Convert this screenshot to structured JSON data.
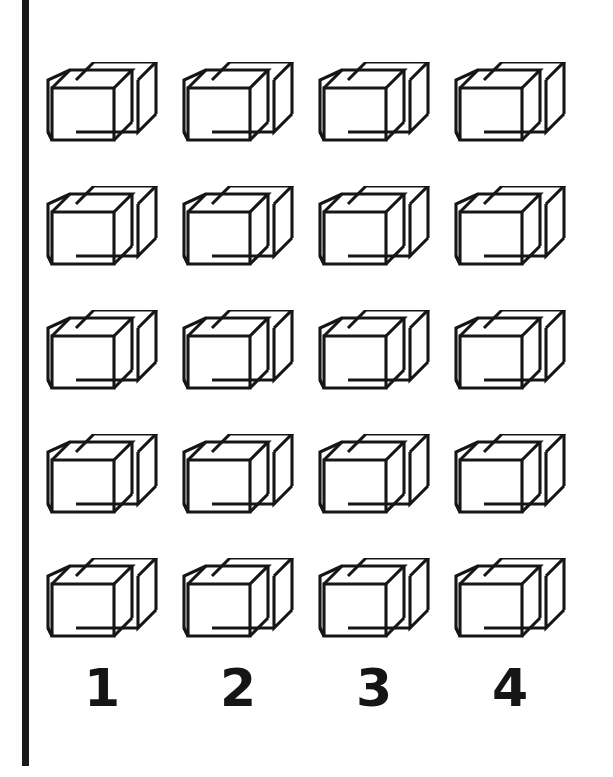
{
  "figure": {
    "name": "cube-grid-figure",
    "background_color": "#ffffff",
    "ink_color": "#161616",
    "rows": 5,
    "columns": 4,
    "total_cubes": 20,
    "shape_name": "necker-cube-outline"
  },
  "left_rule": {
    "name": "left-vertical-rule",
    "color": "#1a1a1a"
  },
  "columns": [
    {
      "index": 1,
      "label": "1",
      "x": 0
    },
    {
      "index": 2,
      "label": "2",
      "x": 136
    },
    {
      "index": 3,
      "label": "3",
      "x": 272
    },
    {
      "index": 4,
      "label": "4",
      "x": 408
    }
  ],
  "rows": [
    {
      "index": 1,
      "y": 0
    },
    {
      "index": 2,
      "y": 124
    },
    {
      "index": 3,
      "y": 248
    },
    {
      "index": 4,
      "y": 372
    },
    {
      "index": 5,
      "y": 496
    }
  ],
  "cells": [
    {
      "row": 1,
      "column": 1,
      "label": "cube-r1-c1"
    },
    {
      "row": 1,
      "column": 2,
      "label": "cube-r1-c2"
    },
    {
      "row": 1,
      "column": 3,
      "label": "cube-r1-c3"
    },
    {
      "row": 1,
      "column": 4,
      "label": "cube-r1-c4"
    },
    {
      "row": 2,
      "column": 1,
      "label": "cube-r2-c1"
    },
    {
      "row": 2,
      "column": 2,
      "label": "cube-r2-c2"
    },
    {
      "row": 2,
      "column": 3,
      "label": "cube-r2-c3"
    },
    {
      "row": 2,
      "column": 4,
      "label": "cube-r2-c4"
    },
    {
      "row": 3,
      "column": 1,
      "label": "cube-r3-c1"
    },
    {
      "row": 3,
      "column": 2,
      "label": "cube-r3-c2"
    },
    {
      "row": 3,
      "column": 3,
      "label": "cube-r3-c3"
    },
    {
      "row": 3,
      "column": 4,
      "label": "cube-r3-c4"
    },
    {
      "row": 4,
      "column": 1,
      "label": "cube-r4-c1"
    },
    {
      "row": 4,
      "column": 2,
      "label": "cube-r4-c2"
    },
    {
      "row": 4,
      "column": 3,
      "label": "cube-r4-c3"
    },
    {
      "row": 4,
      "column": 4,
      "label": "cube-r4-c4"
    },
    {
      "row": 5,
      "column": 1,
      "label": "cube-r5-c1"
    },
    {
      "row": 5,
      "column": 2,
      "label": "cube-r5-c2"
    },
    {
      "row": 5,
      "column": 3,
      "label": "cube-r5-c3"
    },
    {
      "row": 5,
      "column": 4,
      "label": "cube-r5-c4"
    }
  ]
}
